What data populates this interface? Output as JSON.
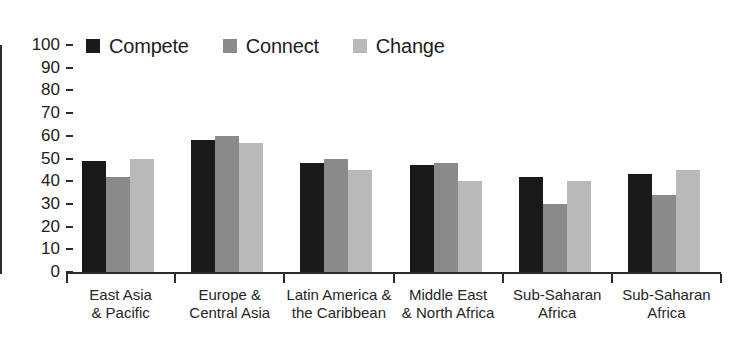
{
  "chart_data": {
    "type": "bar",
    "title": "",
    "subtitle": "",
    "xlabel": "",
    "ylabel": "",
    "ylim": [
      0,
      100
    ],
    "ytick_step": 10,
    "yticks": [
      100,
      90,
      80,
      70,
      60,
      50,
      40,
      30,
      20,
      10,
      0
    ],
    "grid": false,
    "legend_position": "top-left",
    "categories": [
      "East Asia\n& Pacific",
      "Europe &\nCentral Asia",
      "Latin America &\nthe Caribbean",
      "Middle East\n& North Africa",
      "Sub-Saharan\nAfrica",
      "Sub-Saharan\nAfrica"
    ],
    "series": [
      {
        "name": "Compete",
        "color": "#1a1a1a",
        "values": [
          49,
          58,
          48,
          47,
          42,
          43
        ]
      },
      {
        "name": "Connect",
        "color": "#8a8a8a",
        "values": [
          42,
          60,
          50,
          48,
          30,
          34
        ]
      },
      {
        "name": "Change",
        "color": "#b9b9b9",
        "values": [
          50,
          57,
          45,
          40,
          40,
          45
        ]
      }
    ]
  },
  "axis": {
    "line_color": "#2b2b2b"
  },
  "legend": {
    "items": [
      {
        "label": "Compete",
        "color": "#1a1a1a"
      },
      {
        "label": "Connect",
        "color": "#8a8a8a"
      },
      {
        "label": "Change",
        "color": "#b9b9b9"
      }
    ]
  }
}
